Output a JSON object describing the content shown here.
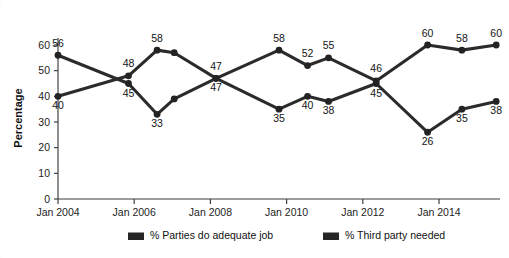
{
  "chart_data": {
    "type": "line",
    "title": "",
    "subtitle": "",
    "xlabel": "",
    "ylabel": "Percentage",
    "ylim": [
      0,
      60
    ],
    "ytick_values": [
      0,
      10,
      20,
      30,
      40,
      50,
      60
    ],
    "ytick_labels": [
      "0",
      "10",
      "20",
      "30",
      "40",
      "50",
      "60"
    ],
    "xtick_labels": [
      "Jan 2004",
      "Jan 2006",
      "Jan 2008",
      "Jan 2010",
      "Jan 2012",
      "Jan 2014"
    ],
    "xtick_positions": [
      0,
      2,
      4,
      6,
      8,
      10
    ],
    "xlim": [
      0,
      11.6
    ],
    "grid": false,
    "legend_position": "bottom",
    "x": [
      0,
      1.85,
      2.6,
      3.05,
      4.15,
      5.8,
      6.55,
      7.1,
      8.35,
      9.7,
      10.6,
      11.5
    ],
    "series": [
      {
        "name": "% Parties do adequate job",
        "color": "#262626",
        "values": [
          56,
          45,
          33,
          39,
          47,
          35,
          40,
          38,
          45,
          26,
          35,
          38
        ],
        "labels": [
          "56",
          "45",
          "33",
          "",
          "47",
          "35",
          "40",
          "38",
          "45",
          "26",
          "35",
          "38"
        ],
        "label_side": [
          "above",
          "below",
          "below",
          "",
          "below",
          "below",
          "below",
          "below",
          "below",
          "below",
          "below",
          "below"
        ]
      },
      {
        "name": "% Third party needed",
        "color": "#262626",
        "values": [
          40,
          48,
          58,
          57,
          47,
          58,
          52,
          55,
          46,
          60,
          58,
          60
        ],
        "labels": [
          "40",
          "48",
          "58",
          "",
          "47",
          "58",
          "52",
          "55",
          "46",
          "60",
          "58",
          "60"
        ],
        "label_side": [
          "below",
          "above",
          "above",
          "",
          "above",
          "above",
          "above",
          "above",
          "above",
          "above",
          "above",
          "above"
        ]
      }
    ]
  },
  "legend": {
    "items": [
      {
        "label": "% Parties do adequate job"
      },
      {
        "label": "% Third party needed"
      }
    ]
  }
}
